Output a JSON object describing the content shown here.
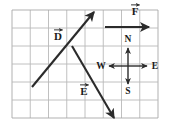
{
  "figure": {
    "type": "vector-diagram",
    "background_color": "#ffffff",
    "grid": {
      "columns": 8,
      "rows": 6,
      "x0": 12,
      "y0": 10,
      "cell_width": 18.25,
      "cell_height": 18.0,
      "line_color": "#b9b9b9",
      "border_color": "#a8a8a8",
      "line_width": 0.9
    },
    "vector_color": "#2b2b2b",
    "label_color": "#1a1a1a",
    "vectors": [
      {
        "id": "vector-d",
        "label": "D",
        "label_text": "D",
        "accent": "arrow-over",
        "x1": 32,
        "y1": 87,
        "x2": 94,
        "y2": 12,
        "label_x": 58,
        "label_y": 40,
        "direction": "up-right"
      },
      {
        "id": "vector-e",
        "label": "E",
        "label_text": "E",
        "accent": "arrow-over",
        "x1": 72,
        "y1": 46,
        "x2": 114,
        "y2": 118,
        "label_x": 84,
        "label_y": 95,
        "direction": "down-right"
      },
      {
        "id": "vector-f",
        "label": "F",
        "label_text": "F",
        "accent": "arrow-over",
        "x1": 105,
        "y1": 27,
        "x2": 149,
        "y2": 27,
        "label_x": 135,
        "label_y": 15,
        "direction": "right"
      }
    ],
    "compass": {
      "id": "compass-rose",
      "center_x": 128,
      "center_y": 66,
      "arm_length_horizontal": 19,
      "arm_length_vertical": 18,
      "points": [
        {
          "id": "compass-north",
          "label": "N",
          "label_x": 128,
          "label_y": 42
        },
        {
          "id": "compass-south",
          "label": "S",
          "label_x": 128,
          "label_y": 94
        },
        {
          "id": "compass-east",
          "label": "E",
          "label_x": 155,
          "label_y": 69
        },
        {
          "id": "compass-west",
          "label": "W",
          "label_x": 101,
          "label_y": 69
        }
      ]
    }
  }
}
